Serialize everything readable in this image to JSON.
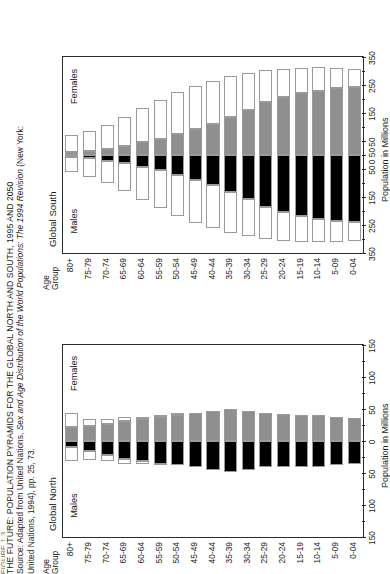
{
  "caption": {
    "clipped_line": "FIGURE 1.3",
    "title": "THE FUTURE: POPULATION PYRAMIDS FOR THE GLOBAL NORTH AND SOUTH, 1995 AND 2050",
    "source_prefix": "Source: Adapted from United Nations, ",
    "source_italic": "Sex and Age Distribution of the World Populations: The 1994 Revision ",
    "source_suffix": "(New York:",
    "source_line2": "United Nations, 1994), pp. 25, 73."
  },
  "common": {
    "age_group_header_line1": "Age",
    "age_group_header_line2": "Group",
    "males_label": "Males",
    "females_label": "Females",
    "axis_title": "Population in Millions",
    "legend_males": "Males",
    "legend_females": "Females",
    "colors": {
      "males_1995": "#000000",
      "females_1995": "#8f8f8f",
      "projection_2050": "#ffffff",
      "frame": "#2b2b2b",
      "bar_outline": "#9a9a9a"
    },
    "age_groups": [
      "80+",
      "75-79",
      "70-74",
      "65-69",
      "60-64",
      "55-59",
      "50-54",
      "45-49",
      "40-44",
      "35-39",
      "30-34",
      "25-29",
      "20-24",
      "15-19",
      "10-14",
      "5-09",
      "0-04"
    ]
  },
  "chart_data": [
    {
      "type": "bar",
      "title": "Global South",
      "subtype": "population-pyramid",
      "xlabel": "Population in Millions",
      "ylabel": "Age Group",
      "xlim": [
        -350,
        350
      ],
      "tick_values": [
        -350,
        -250,
        -150,
        -50,
        0,
        50,
        150,
        250,
        350
      ],
      "tick_labels": [
        "350",
        "250",
        "150",
        "50",
        "0 50",
        "50",
        "150",
        "250",
        "350"
      ],
      "minor_tick_step": 50,
      "grid": false,
      "legend_position": "bottom-right",
      "categories": [
        "80+",
        "75-79",
        "70-74",
        "65-69",
        "60-64",
        "55-59",
        "50-54",
        "45-49",
        "40-44",
        "35-39",
        "30-34",
        "25-29",
        "20-24",
        "15-19",
        "10-14",
        "5-09",
        "0-04"
      ],
      "series": [
        {
          "name": "Males 1995",
          "side": "left",
          "fill": "#000000",
          "values": [
            8,
            12,
            20,
            30,
            42,
            55,
            70,
            88,
            108,
            132,
            158,
            186,
            205,
            218,
            228,
            236,
            240
          ]
        },
        {
          "name": "Males 2050",
          "side": "left",
          "fill": "#ffffff",
          "values": [
            62,
            78,
            100,
            128,
            160,
            190,
            218,
            242,
            262,
            278,
            290,
            300,
            306,
            310,
            312,
            310,
            306
          ]
        },
        {
          "name": "Females 1995",
          "side": "right",
          "fill": "#8f8f8f",
          "values": [
            10,
            14,
            22,
            33,
            45,
            58,
            74,
            92,
            112,
            136,
            162,
            190,
            208,
            220,
            230,
            238,
            242
          ]
        },
        {
          "name": "Females 2050",
          "side": "right",
          "fill": "#ffffff",
          "values": [
            70,
            86,
            108,
            136,
            168,
            198,
            224,
            248,
            266,
            282,
            292,
            302,
            308,
            312,
            314,
            312,
            308
          ]
        }
      ]
    },
    {
      "type": "bar",
      "title": "Global North",
      "subtype": "population-pyramid",
      "xlabel": "Population in Millions",
      "ylabel": "Age Group",
      "xlim": [
        -150,
        150
      ],
      "tick_values": [
        -150,
        -100,
        -50,
        0,
        50,
        100,
        150
      ],
      "tick_labels": [
        "150",
        "100",
        "50",
        "0",
        "50",
        "100",
        "150"
      ],
      "minor_tick_step": 25,
      "grid": false,
      "legend_position": "bottom-right",
      "categories": [
        "80+",
        "75-79",
        "70-74",
        "65-69",
        "60-64",
        "55-59",
        "50-54",
        "45-49",
        "40-44",
        "35-39",
        "30-34",
        "25-29",
        "20-24",
        "15-19",
        "10-14",
        "5-09",
        "0-04"
      ],
      "series": [
        {
          "name": "Males 1995",
          "side": "left",
          "fill": "#000000",
          "values": [
            10,
            16,
            22,
            28,
            31,
            36,
            38,
            40,
            45,
            48,
            46,
            41,
            40,
            40,
            40,
            37,
            36
          ]
        },
        {
          "name": "Males 2050",
          "side": "left",
          "fill": "#ffffff",
          "values": [
            32,
            30,
            32,
            36,
            36,
            38,
            38,
            40,
            45,
            48,
            46,
            41,
            40,
            40,
            40,
            37,
            36
          ]
        },
        {
          "name": "Females 1995",
          "side": "right",
          "fill": "#8f8f8f",
          "values": [
            22,
            24,
            27,
            32,
            34,
            38,
            40,
            43,
            47,
            50,
            47,
            43,
            42,
            41,
            41,
            38,
            36
          ]
        },
        {
          "name": "Females 2050",
          "side": "right",
          "fill": "#ffffff",
          "values": [
            44,
            34,
            34,
            38,
            38,
            40,
            42,
            43,
            47,
            50,
            47,
            43,
            42,
            41,
            41,
            38,
            36
          ]
        }
      ]
    }
  ]
}
